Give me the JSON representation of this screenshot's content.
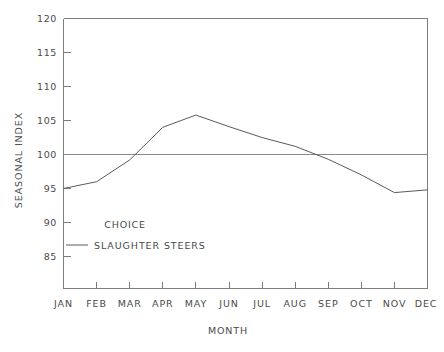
{
  "chart_data": {
    "type": "line",
    "title": "",
    "subtitle": "",
    "xlabel": "MONTH",
    "ylabel": "SEASONAL INDEX",
    "categories": [
      "JAN",
      "FEB",
      "MAR",
      "APR",
      "MAY",
      "JUN",
      "JUL",
      "AUG",
      "SEP",
      "OCT",
      "NOV",
      "DEC"
    ],
    "series": [
      {
        "name": "SLAUGHTER STEERS",
        "values": [
          95.0,
          96.0,
          99.2,
          104.0,
          105.8,
          104.1,
          102.5,
          101.2,
          99.3,
          97.0,
          94.4,
          94.8
        ]
      }
    ],
    "ylim": [
      82,
      120
    ],
    "yticks": [
      85,
      90,
      95,
      100,
      105,
      110,
      115,
      120
    ],
    "ytick_labels": [
      "85",
      "90",
      "95",
      "100",
      "105",
      "110",
      "115",
      "120"
    ],
    "reference_line": 100,
    "grid": false,
    "legend_position": "inside-lower-left",
    "legend": {
      "title": "CHOICE",
      "entries": [
        "SLAUGHTER STEERS"
      ]
    },
    "colors": {
      "series": "#5a5a5a",
      "axis": "#7d7d7d",
      "reference": "#8a8a8a",
      "text": "#4a4a4a",
      "background": "#ffffff"
    }
  },
  "axes": {
    "y_label_text": "SEASONAL INDEX",
    "x_label_text": "MONTH"
  }
}
